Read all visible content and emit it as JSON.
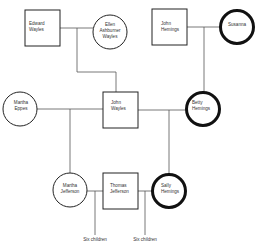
{
  "diagram": {
    "type": "family-tree",
    "colors": {
      "line": "#555555",
      "stroke": "#222222",
      "thick_stroke": "#111111",
      "fill": "#ffffff",
      "text": "#333333"
    },
    "people": [
      {
        "id": "edward-wayles",
        "shape": "square",
        "border": "thin",
        "lines": [
          "Edward",
          "Wayles"
        ]
      },
      {
        "id": "ellen-ashburner-wayles",
        "shape": "circle",
        "border": "thin",
        "lines": [
          "Ellen",
          "Ashburner",
          "Wayles"
        ]
      },
      {
        "id": "john-hemings",
        "shape": "square",
        "border": "thin",
        "lines": [
          "John",
          "Hemings"
        ]
      },
      {
        "id": "susanna",
        "shape": "circle",
        "border": "thick",
        "lines": [
          "Susanna"
        ]
      },
      {
        "id": "martha-eppes",
        "shape": "circle",
        "border": "thin",
        "lines": [
          "Martha",
          "Eppes"
        ]
      },
      {
        "id": "john-wayles",
        "shape": "square",
        "border": "thin",
        "lines": [
          "John",
          "Wayles"
        ]
      },
      {
        "id": "betty-hemings",
        "shape": "circle",
        "border": "thick",
        "lines": [
          "Betty",
          "Hemings"
        ]
      },
      {
        "id": "martha-jefferson",
        "shape": "circle",
        "border": "thin",
        "lines": [
          "Martha",
          "Jefferson"
        ]
      },
      {
        "id": "thomas-jefferson",
        "shape": "square",
        "border": "thin",
        "lines": [
          "Thomas",
          "Jefferson"
        ]
      },
      {
        "id": "sally-hemings",
        "shape": "circle",
        "border": "thick",
        "lines": [
          "Sally",
          "Hemings"
        ]
      }
    ],
    "notes": [
      {
        "id": "children-martha-thomas",
        "text": "Six children"
      },
      {
        "id": "children-sally-thomas",
        "text": "Six children"
      }
    ],
    "relationships": [
      {
        "type": "union",
        "a": "edward-wayles",
        "b": "ellen-ashburner-wayles",
        "child": "john-wayles"
      },
      {
        "type": "union",
        "a": "john-hemings",
        "b": "susanna",
        "child": "betty-hemings"
      },
      {
        "type": "union",
        "a": "martha-eppes",
        "b": "john-wayles",
        "child": "martha-jefferson"
      },
      {
        "type": "union",
        "a": "john-wayles",
        "b": "betty-hemings",
        "child": "sally-hemings"
      },
      {
        "type": "union",
        "a": "martha-jefferson",
        "b": "thomas-jefferson",
        "child": "children-martha-thomas"
      },
      {
        "type": "union",
        "a": "thomas-jefferson",
        "b": "sally-hemings",
        "child": "children-sally-thomas"
      }
    ]
  }
}
